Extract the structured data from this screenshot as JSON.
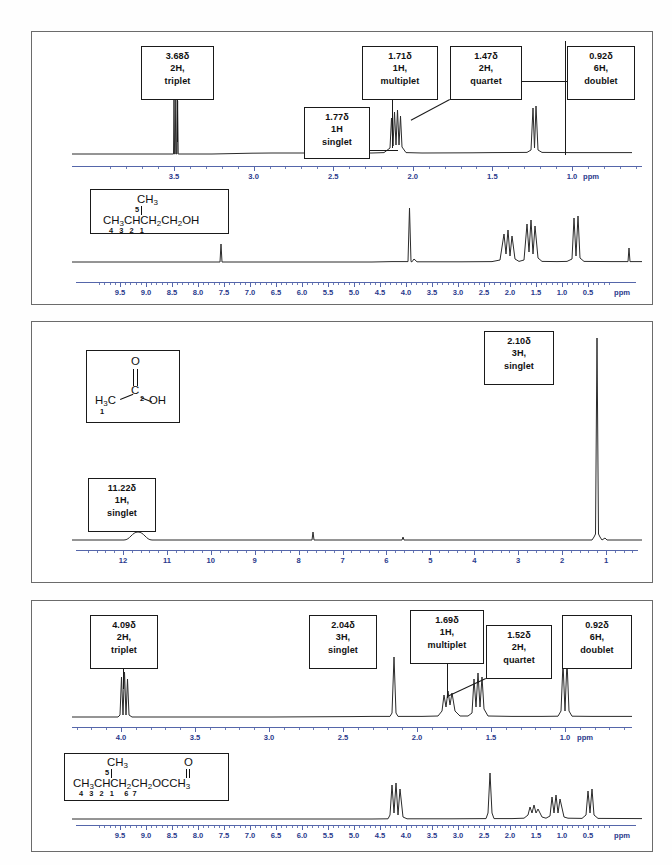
{
  "document": {
    "title": "1H NMR Spectra Comparison Worksheet",
    "panel_count": 3
  },
  "axis_common": {
    "ppm_label": "ppm"
  },
  "panels": [
    {
      "id": "panel-1",
      "name": "3-methyl-1-butanol",
      "structure": {
        "branch_label": "CH3",
        "branch_locant": "5",
        "main_chain": "CH3CHCH2CH2OH",
        "locants": [
          "4",
          "3",
          "2",
          "1"
        ]
      },
      "expanded_axis": {
        "ticks": [
          "3.5",
          "3.0",
          "2.5",
          "2.0",
          "1.5",
          "1.0"
        ],
        "ppm_label": "ppm"
      },
      "full_axis": {
        "ticks": [
          "9.5",
          "9.0",
          "8.5",
          "8.0",
          "7.5",
          "7.0",
          "6.5",
          "6.0",
          "5.5",
          "5.0",
          "4.5",
          "4.0",
          "3.5",
          "3.0",
          "2.5",
          "2.0",
          "1.5",
          "1.0",
          "0.5"
        ],
        "ppm_label": "ppm"
      },
      "callouts": [
        {
          "shift": "3.68δ",
          "protons": "2H,",
          "multiplicity": "triplet"
        },
        {
          "shift": "1.77δ",
          "protons": "1H",
          "multiplicity": "singlet"
        },
        {
          "shift": "1.71δ",
          "protons": "1H,",
          "multiplicity": "multiplet"
        },
        {
          "shift": "1.47δ",
          "protons": "2H,",
          "multiplicity": "quartet"
        },
        {
          "shift": "0.92δ",
          "protons": "6H,",
          "multiplicity": "doublet"
        }
      ]
    },
    {
      "id": "panel-2",
      "name": "acetic acid",
      "structure": {
        "methyl": "H3C",
        "carbonyl_oxygen": "O",
        "carbon": "C",
        "hydroxyl": "OH",
        "locants": [
          "1",
          "2"
        ]
      },
      "full_axis": {
        "ticks": [
          "12",
          "11",
          "10",
          "9",
          "8",
          "7",
          "6",
          "5",
          "4",
          "3",
          "2",
          "1"
        ],
        "ppm_label": ""
      },
      "callouts": [
        {
          "shift": "11.22δ",
          "protons": "1H,",
          "multiplicity": "singlet"
        },
        {
          "shift": "2.10δ",
          "protons": "3H,",
          "multiplicity": "singlet"
        }
      ]
    },
    {
      "id": "panel-3",
      "name": "isoamyl acetate",
      "structure": {
        "branch_label": "CH3",
        "branch_locant": "5",
        "carbonyl_oxygen": "O",
        "main_chain": "CH3CHCH2CH2OCCH3",
        "locants": [
          "4",
          "3",
          "2",
          "1",
          "6",
          "7"
        ]
      },
      "expanded_axis": {
        "ticks": [
          "4.0",
          "3.5",
          "3.0",
          "2.5",
          "2.0",
          "1.5",
          "1.0"
        ],
        "ppm_label": "ppm"
      },
      "full_axis": {
        "ticks": [
          "9.5",
          "9.0",
          "8.5",
          "8.0",
          "7.5",
          "7.0",
          "6.5",
          "6.0",
          "5.5",
          "5.0",
          "4.5",
          "4.0",
          "3.5",
          "3.0",
          "2.5",
          "2.0",
          "1.5",
          "1.0",
          "0.5"
        ],
        "ppm_label": "ppm"
      },
      "callouts": [
        {
          "shift": "4.09δ",
          "protons": "2H,",
          "multiplicity": "triplet"
        },
        {
          "shift": "2.04δ",
          "protons": "3H,",
          "multiplicity": "singlet"
        },
        {
          "shift": "1.69δ",
          "protons": "1H,",
          "multiplicity": "multiplet"
        },
        {
          "shift": "1.52δ",
          "protons": "2H,",
          "multiplicity": "quartet"
        },
        {
          "shift": "0.92δ",
          "protons": "6H,",
          "multiplicity": "doublet"
        }
      ]
    }
  ],
  "chart_data": [
    {
      "type": "line",
      "title": "3-methyl-1-butanol expanded 1H NMR",
      "xlabel": "ppm",
      "ylabel": "intensity",
      "xlim": [
        3.9,
        0.55
      ],
      "grid": false,
      "peaks": [
        {
          "ppm": 3.68,
          "height": 0.78,
          "assignment": "2H triplet"
        },
        {
          "ppm": 1.77,
          "height": 0.1,
          "assignment": "1H singlet (OH)"
        },
        {
          "ppm": 1.71,
          "height": 0.3,
          "assignment": "1H multiplet"
        },
        {
          "ppm": 1.47,
          "height": 0.47,
          "assignment": "2H quartet"
        },
        {
          "ppm": 0.92,
          "height": 0.74,
          "assignment": "6H doublet"
        }
      ]
    },
    {
      "type": "line",
      "title": "3-methyl-1-butanol full 1H NMR",
      "xlabel": "ppm",
      "ylabel": "intensity",
      "xlim": [
        10.0,
        0.0
      ],
      "grid": false,
      "peaks": [
        {
          "ppm": 7.26,
          "height": 0.12,
          "assignment": "solvent"
        },
        {
          "ppm": 3.68,
          "height": 0.86,
          "assignment": "2H triplet"
        },
        {
          "ppm": 1.71,
          "height": 0.3,
          "assignment": "1H multiplet"
        },
        {
          "ppm": 1.47,
          "height": 0.42,
          "assignment": "2H quartet"
        },
        {
          "ppm": 0.92,
          "height": 0.68,
          "assignment": "6H doublet"
        },
        {
          "ppm": 0.0,
          "height": 0.14,
          "assignment": "TMS"
        }
      ]
    },
    {
      "type": "line",
      "title": "acetic acid full 1H NMR",
      "xlabel": "ppm",
      "ylabel": "intensity",
      "xlim": [
        12.6,
        0.4
      ],
      "grid": false,
      "peaks": [
        {
          "ppm": 11.22,
          "height": 0.05,
          "assignment": "1H singlet (COOH, broad)"
        },
        {
          "ppm": 7.26,
          "height": 0.05,
          "assignment": "solvent"
        },
        {
          "ppm": 5.0,
          "height": 0.03,
          "assignment": "trace"
        },
        {
          "ppm": 2.1,
          "height": 0.95,
          "assignment": "3H singlet"
        }
      ]
    },
    {
      "type": "line",
      "title": "isoamyl acetate expanded 1H NMR",
      "xlabel": "ppm",
      "ylabel": "intensity",
      "xlim": [
        4.35,
        0.6
      ],
      "grid": false,
      "peaks": [
        {
          "ppm": 4.09,
          "height": 0.55,
          "assignment": "2H triplet"
        },
        {
          "ppm": 2.04,
          "height": 0.88,
          "assignment": "3H singlet"
        },
        {
          "ppm": 1.69,
          "height": 0.22,
          "assignment": "1H multiplet"
        },
        {
          "ppm": 1.52,
          "height": 0.4,
          "assignment": "2H quartet"
        },
        {
          "ppm": 0.92,
          "height": 0.8,
          "assignment": "6H doublet"
        }
      ]
    },
    {
      "type": "line",
      "title": "isoamyl acetate full 1H NMR",
      "xlabel": "ppm",
      "ylabel": "intensity",
      "xlim": [
        10.0,
        0.0
      ],
      "grid": false,
      "peaks": [
        {
          "ppm": 4.09,
          "height": 0.6,
          "assignment": "2H triplet"
        },
        {
          "ppm": 2.04,
          "height": 0.9,
          "assignment": "3H singlet"
        },
        {
          "ppm": 1.69,
          "height": 0.18,
          "assignment": "1H multiplet"
        },
        {
          "ppm": 1.52,
          "height": 0.3,
          "assignment": "2H quartet"
        },
        {
          "ppm": 0.92,
          "height": 0.5,
          "assignment": "6H doublet"
        }
      ]
    }
  ]
}
